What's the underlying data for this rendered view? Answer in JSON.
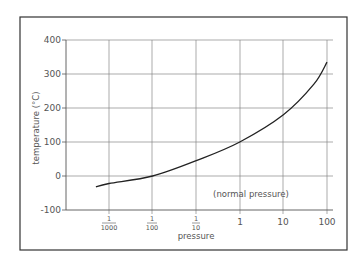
{
  "chart_data": {
    "type": "line",
    "title": "",
    "xlabel": "pressure",
    "ylabel": "temperature (°C)",
    "x_scale": "log",
    "x_tick_labels": [
      "1/1000",
      "1/100",
      "1/10",
      "1",
      "10",
      "100"
    ],
    "x_tick_values": [
      0.001,
      0.01,
      0.1,
      1,
      10,
      100
    ],
    "y_tick_labels": [
      "400",
      "300",
      "200",
      "100",
      "0",
      "-100"
    ],
    "y_tick_values": [
      400,
      300,
      200,
      100,
      0,
      -100
    ],
    "ylim": [
      -100,
      400
    ],
    "xlim": [
      0.0003,
      150
    ],
    "grid": true,
    "annotations": [
      {
        "text": "(normal pressure)",
        "x": 1,
        "y": -60
      }
    ],
    "series": [
      {
        "name": "boiling point of water",
        "x": [
          0.0005,
          0.001,
          0.01,
          0.1,
          1,
          10,
          50,
          100
        ],
        "y": [
          -32,
          -22,
          0,
          45,
          100,
          180,
          270,
          335
        ]
      }
    ]
  },
  "labels": {
    "ylabel": "temperature (°C)",
    "xlabel": "pressure",
    "annotation": "(normal pressure)",
    "y_ticks": [
      "400",
      "300",
      "200",
      "100",
      "0",
      "-100"
    ],
    "x_ticks": [
      {
        "num": "1",
        "den": "1000"
      },
      {
        "num": "1",
        "den": "100"
      },
      {
        "num": "1",
        "den": "10"
      },
      {
        "whole": "1"
      },
      {
        "whole": "10"
      },
      {
        "whole": "100"
      }
    ]
  }
}
